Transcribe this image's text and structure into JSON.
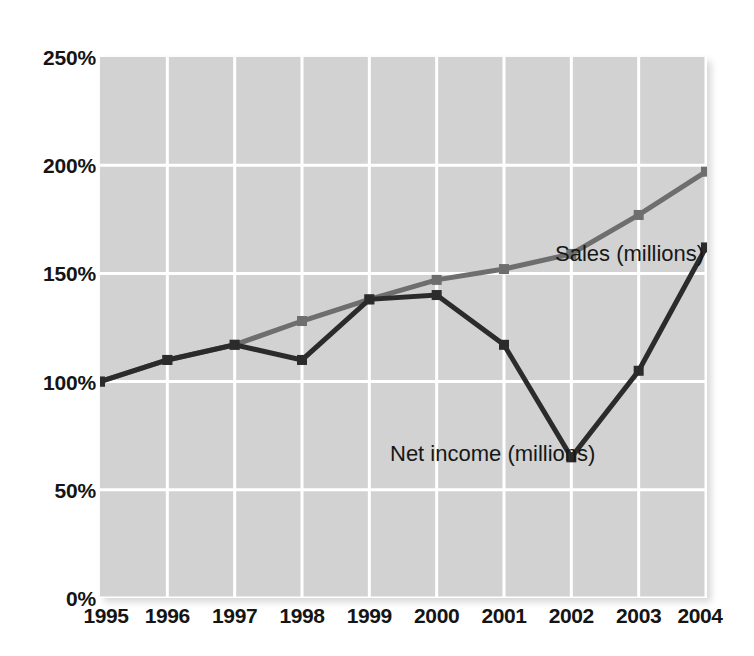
{
  "figure": {
    "title": "",
    "background_color": "#ffffff",
    "plot_background_color": "#d2d2d2",
    "gridline_color": "#ffffff"
  },
  "axes": {
    "y_ticks": [
      "250%",
      "200%",
      "150%",
      "100%",
      "50%",
      "0%"
    ],
    "y_tick_values": [
      250,
      200,
      150,
      100,
      50,
      0
    ],
    "x_ticks": [
      "1995",
      "1996",
      "1997",
      "1998",
      "1999",
      "2000",
      "2001",
      "2002",
      "2003",
      "2004"
    ]
  },
  "annotations": {
    "sales_label": "Sales (millions)",
    "net_income_label": "Net income (millions)"
  },
  "colors": {
    "sales_line": "#6e6e6e",
    "net_income_line": "#2b2b2b",
    "plot_background": "#d2d2d2",
    "gridline": "#ffffff",
    "text": "#151515"
  },
  "chart_data": {
    "type": "line",
    "title": "",
    "xlabel": "",
    "ylabel": "",
    "ylim": [
      0,
      250
    ],
    "ytick_step": 50,
    "grid": true,
    "legend_position": "inline-annotation",
    "categories": [
      "1995",
      "1996",
      "1997",
      "1998",
      "1999",
      "2000",
      "2001",
      "2002",
      "2003",
      "2004"
    ],
    "x": [
      1995,
      1996,
      1997,
      1998,
      1999,
      2000,
      2001,
      2002,
      2003,
      2004
    ],
    "series": [
      {
        "name": "Sales (millions)",
        "color": "#6e6e6e",
        "values": [
          100,
          110,
          117,
          128,
          138,
          147,
          152,
          159,
          177,
          197
        ]
      },
      {
        "name": "Net income (millions)",
        "color": "#2b2b2b",
        "values": [
          100,
          110,
          117,
          110,
          138,
          140,
          117,
          65,
          105,
          162
        ]
      }
    ]
  }
}
